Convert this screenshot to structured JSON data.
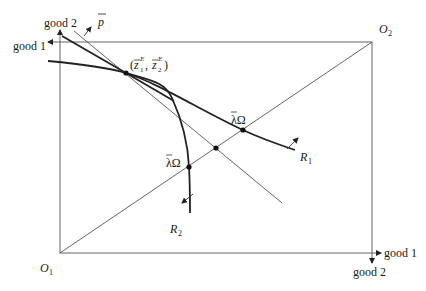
{
  "labels": {
    "o1": "O",
    "o1_sub": "1",
    "o2": "O",
    "o2_sub": "2",
    "good1_left": "good 1",
    "good2_top": "good 2",
    "good1_right": "good 1",
    "good2_bottom": "good 2",
    "price": "p",
    "equilibrium_open": "(",
    "equilibrium_z1": "z",
    "equilibrium_z1_sub": "1",
    "equilibrium_sup": "E",
    "equilibrium_sep": ", ",
    "equilibrium_z2": "z",
    "equilibrium_z2_sub": "2",
    "equilibrium_close": ")",
    "lambda_omega_upper": "λΩ",
    "lambda_omega_lower": "λΩ",
    "r1": "R",
    "r1_sub": "1",
    "r2": "R",
    "r2_sub": "2"
  },
  "geometry": {
    "box": {
      "x1": 60,
      "y1": 42,
      "x2": 372,
      "y2": 253
    },
    "equilibrium_point": [
      126,
      73
    ],
    "lambda_omega_r1_point": [
      243,
      130
    ],
    "diagonal_price_intersection": [
      216,
      148
    ],
    "lambda_omega_r2_point": [
      189,
      167
    ]
  },
  "colors": {
    "line": "#555555",
    "curve": "#222222",
    "text": "#1a1a1a"
  }
}
